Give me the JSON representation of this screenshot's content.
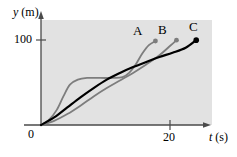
{
  "figure": {
    "background_color": "#ffffff",
    "plot_area_color": "#e2e2e2",
    "axis_color": "#3a3a3a"
  },
  "axes": {
    "y_label_var": "y",
    "y_label_unit": " (m)",
    "x_label_var": "t",
    "x_label_unit": " (s)",
    "origin_label": "0",
    "y_ticks": [
      "100"
    ],
    "x_ticks": [
      "20"
    ]
  },
  "labels": {
    "a": "A",
    "b": "B",
    "c": "C"
  },
  "chart_data": {
    "type": "line",
    "title": "",
    "xlabel": "t (s)",
    "ylabel": "y (m)",
    "xlim": [
      0,
      26
    ],
    "ylim": [
      0,
      125
    ],
    "grid": false,
    "legend": "inline end-of-curve labels",
    "x_ticks": [
      0,
      20
    ],
    "y_ticks": [
      0,
      100
    ],
    "annotations": [
      {
        "text": "A",
        "at_end_of_series": "A"
      },
      {
        "text": "B",
        "at_end_of_series": "B"
      },
      {
        "text": "C",
        "at_end_of_series": "C"
      }
    ],
    "series": [
      {
        "name": "A",
        "color": "#7d7d7d",
        "width": 1.8,
        "endpoint_marker": true,
        "description": "rises steeply, plateaus near 55 m, then rises steeply again to 100 m",
        "points": [
          {
            "t": 0.0,
            "y": 0
          },
          {
            "t": 1.2,
            "y": 6
          },
          {
            "t": 2.4,
            "y": 18
          },
          {
            "t": 3.4,
            "y": 34
          },
          {
            "t": 4.4,
            "y": 48
          },
          {
            "t": 5.6,
            "y": 54
          },
          {
            "t": 7.0,
            "y": 56
          },
          {
            "t": 9.0,
            "y": 56
          },
          {
            "t": 11.0,
            "y": 56
          },
          {
            "t": 12.4,
            "y": 57
          },
          {
            "t": 13.4,
            "y": 62
          },
          {
            "t": 14.4,
            "y": 72
          },
          {
            "t": 15.4,
            "y": 85
          },
          {
            "t": 16.4,
            "y": 95
          },
          {
            "t": 17.4,
            "y": 100
          }
        ]
      },
      {
        "name": "B",
        "color": "#7d7d7d",
        "width": 1.8,
        "endpoint_marker": true,
        "description": "slow concave start, nearly linear middle, steepens to 100 m",
        "points": [
          {
            "t": 0.0,
            "y": 0
          },
          {
            "t": 2.0,
            "y": 5
          },
          {
            "t": 4.0,
            "y": 13
          },
          {
            "t": 6.0,
            "y": 23
          },
          {
            "t": 8.0,
            "y": 34
          },
          {
            "t": 10.0,
            "y": 44
          },
          {
            "t": 12.0,
            "y": 53
          },
          {
            "t": 14.0,
            "y": 62
          },
          {
            "t": 16.0,
            "y": 72
          },
          {
            "t": 18.0,
            "y": 83
          },
          {
            "t": 19.6,
            "y": 94
          },
          {
            "t": 20.6,
            "y": 101
          }
        ]
      },
      {
        "name": "C",
        "color": "#000000",
        "width": 2.2,
        "endpoint_marker": true,
        "description": "smooth S-shaped curve, steady rise from 0 to 100 m",
        "points": [
          {
            "t": 0.0,
            "y": 0
          },
          {
            "t": 2.0,
            "y": 9
          },
          {
            "t": 4.0,
            "y": 21
          },
          {
            "t": 6.0,
            "y": 33
          },
          {
            "t": 8.0,
            "y": 44
          },
          {
            "t": 10.0,
            "y": 54
          },
          {
            "t": 12.0,
            "y": 62
          },
          {
            "t": 14.0,
            "y": 69
          },
          {
            "t": 16.0,
            "y": 75
          },
          {
            "t": 18.0,
            "y": 81
          },
          {
            "t": 20.0,
            "y": 86
          },
          {
            "t": 22.0,
            "y": 92
          },
          {
            "t": 23.6,
            "y": 101
          }
        ]
      }
    ]
  }
}
